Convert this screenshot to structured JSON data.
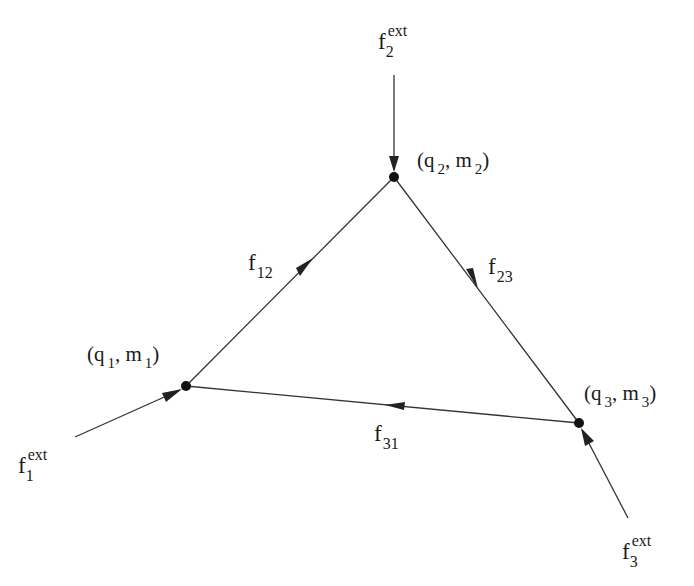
{
  "diagram": {
    "type": "directed-graph",
    "colors": {
      "line": "#333333",
      "node": "#111111",
      "text": "#1a1a1a",
      "background": "#ffffff"
    },
    "nodes": [
      {
        "id": "1",
        "x": 186,
        "y": 386,
        "label": {
          "open": "(q",
          "sub1": "1",
          "sep": ", m",
          "sub2": "1",
          "close": ")"
        }
      },
      {
        "id": "2",
        "x": 394,
        "y": 177,
        "label": {
          "open": "(q",
          "sub1": "2",
          "sep": ", m",
          "sub2": "2",
          "close": ")"
        }
      },
      {
        "id": "3",
        "x": 579,
        "y": 423,
        "label": {
          "open": "(q",
          "sub1": "3",
          "sep": ", m",
          "sub2": "3",
          "close": ")"
        }
      }
    ],
    "edges": [
      {
        "id": "f12",
        "from": "1",
        "to": "2",
        "label": {
          "base": "f",
          "sub": "12"
        }
      },
      {
        "id": "f23",
        "from": "2",
        "to": "3",
        "label": {
          "base": "f",
          "sub": "23"
        }
      },
      {
        "id": "f31",
        "from": "3",
        "to": "1",
        "label": {
          "base": "f",
          "sub": "31"
        }
      }
    ],
    "external_inflows": [
      {
        "id": "f1ext",
        "to": "1",
        "start": [
          75,
          437
        ],
        "label": {
          "base": "f",
          "sub": "1",
          "sup": "ext"
        }
      },
      {
        "id": "f2ext",
        "to": "2",
        "start": [
          394,
          75
        ],
        "label": {
          "base": "f",
          "sub": "2",
          "sup": "ext"
        }
      },
      {
        "id": "f3ext",
        "to": "3",
        "start": [
          628,
          518
        ],
        "label": {
          "base": "f",
          "sub": "3",
          "sup": "ext"
        }
      }
    ]
  }
}
